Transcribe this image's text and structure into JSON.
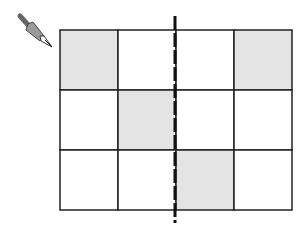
{
  "diagram": {
    "grid": {
      "rows": 3,
      "cols": 4,
      "x": 60,
      "y": 30,
      "cell_w": 58,
      "cell_h": 60,
      "shaded_cells": [
        [
          0,
          0
        ],
        [
          0,
          3
        ],
        [
          1,
          1
        ],
        [
          2,
          2
        ]
      ],
      "shade_color": "#e4e4e4",
      "line_color": "#222222"
    },
    "dashed_line": {
      "x": 175,
      "y1": 16,
      "y2": 223,
      "color": "#111111"
    },
    "pen_icon": {
      "name": "pen-icon"
    }
  }
}
